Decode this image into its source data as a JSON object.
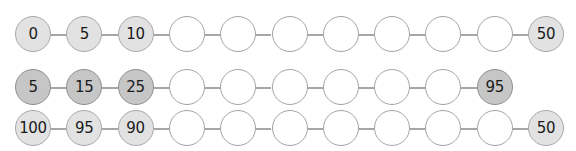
{
  "colors": {
    "empty_fill": "#ffffff",
    "light_fill": "#e2e2e2",
    "dark_fill": "#c6c6c6",
    "border": "#a3a3a3",
    "connector": "#a6a6a6",
    "text": "#1a1a1a"
  },
  "rows": [
    {
      "name": "sequence-row-1",
      "style": "light",
      "nodes": [
        "0",
        "5",
        "10",
        "",
        "",
        "",
        "",
        "",
        "",
        "",
        "50"
      ]
    },
    {
      "name": "sequence-row-2",
      "style": "dark",
      "nodes": [
        "5",
        "15",
        "25",
        "",
        "",
        "",
        "",
        "",
        "",
        "95"
      ]
    },
    {
      "name": "sequence-row-3",
      "style": "light",
      "nodes": [
        "100",
        "95",
        "90",
        "",
        "",
        "",
        "",
        "",
        "",
        "",
        "50"
      ]
    }
  ]
}
